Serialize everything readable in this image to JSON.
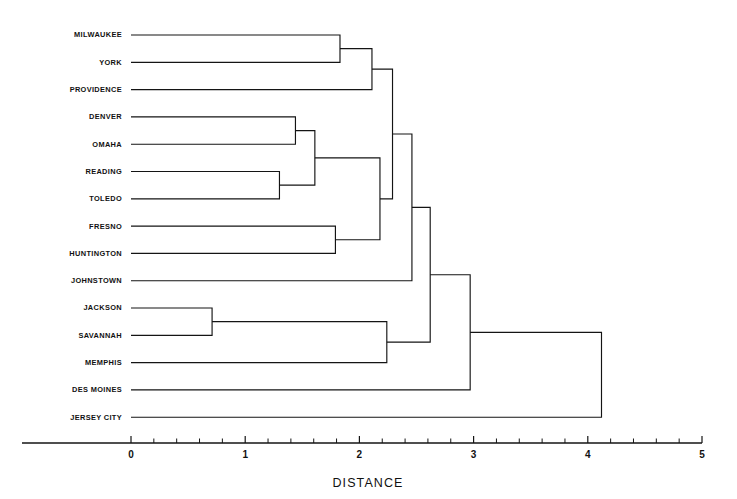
{
  "chart_data": {
    "type": "dendrogram",
    "title": "",
    "xlabel": "DISTANCE",
    "ylabel": "",
    "xlim": [
      0,
      5
    ],
    "grid": false,
    "legend": null,
    "axis": {
      "ticks_major": [
        0,
        1,
        2,
        3,
        4,
        5
      ],
      "tick_labels": [
        "0",
        "1",
        "2",
        "3",
        "4",
        "5"
      ],
      "minor_ticks_per_interval": 5
    },
    "leaves": [
      "MILWAUKEE",
      "YORK",
      "PROVIDENCE",
      "DENVER",
      "OMAHA",
      "READING",
      "TOLEDO",
      "FRESNO",
      "HUNTINGTON",
      "JOHNSTOWN",
      "JACKSON",
      "SAVANNAH",
      "MEMPHIS",
      "DES MOINES",
      "JERSEY CITY"
    ],
    "merges": [
      {
        "id": "m1",
        "label": "MILWAUKEE + YORK",
        "left": "MILWAUKEE",
        "right": "YORK",
        "distance": 1.83
      },
      {
        "id": "m2",
        "label": "(MILWAUKEE,YORK) + PROVIDENCE",
        "left": "m1",
        "right": "PROVIDENCE",
        "distance": 2.11
      },
      {
        "id": "m3",
        "label": "DENVER + OMAHA",
        "left": "DENVER",
        "right": "OMAHA",
        "distance": 1.44
      },
      {
        "id": "m4",
        "label": "READING + TOLEDO",
        "left": "READING",
        "right": "TOLEDO",
        "distance": 1.3
      },
      {
        "id": "m5",
        "label": "(DENVER,OMAHA) + (READING,TOLEDO)",
        "left": "m3",
        "right": "m4",
        "distance": 1.61
      },
      {
        "id": "m6",
        "label": "FRESNO + HUNTINGTON",
        "left": "FRESNO",
        "right": "HUNTINGTON",
        "distance": 1.79
      },
      {
        "id": "m7",
        "label": "m5 + m6",
        "left": "m5",
        "right": "m6",
        "distance": 2.18
      },
      {
        "id": "m8",
        "label": "m2 + m7",
        "left": "m2",
        "right": "m7",
        "distance": 2.29
      },
      {
        "id": "m9",
        "label": "m8 + JOHNSTOWN",
        "left": "m8",
        "right": "JOHNSTOWN",
        "distance": 2.46
      },
      {
        "id": "m10",
        "label": "JACKSON + SAVANNAH",
        "left": "JACKSON",
        "right": "SAVANNAH",
        "distance": 0.71
      },
      {
        "id": "m11",
        "label": "(JACKSON,SAVANNAH) + MEMPHIS",
        "left": "m10",
        "right": "MEMPHIS",
        "distance": 2.24
      },
      {
        "id": "m12",
        "label": "m9 + m11",
        "left": "m9",
        "right": "m11",
        "distance": 2.62
      },
      {
        "id": "m13",
        "label": "m12 + DES MOINES",
        "left": "m12",
        "right": "DES MOINES",
        "distance": 2.97
      },
      {
        "id": "m14",
        "label": "m13 + JERSEY CITY",
        "left": "m13",
        "right": "JERSEY CITY",
        "distance": 4.12
      }
    ],
    "colors": {
      "line": "#141414",
      "text": "#111111",
      "background": "#ffffff"
    }
  },
  "layout": {
    "plot_left_px": 131,
    "plot_right_px": 702,
    "first_row_y_px": 35,
    "row_step_px": 27.3,
    "axis_y_px": 443,
    "label_gap_px": 9
  }
}
